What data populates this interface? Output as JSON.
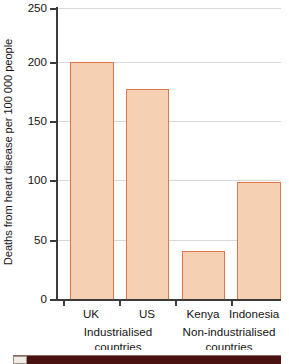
{
  "chart_data": {
    "type": "bar",
    "title": "",
    "xlabel": "",
    "ylabel": "Deaths from heart disease per 100 000 people",
    "categories": [
      "UK",
      "US",
      "Kenya",
      "Indonesia"
    ],
    "values": [
      204,
      181,
      42,
      101
    ],
    "ylim": [
      0,
      250
    ],
    "yticks": [
      0,
      50,
      100,
      150,
      200,
      250
    ],
    "ytick_labels": [
      "0",
      "50",
      "100",
      "150",
      "200",
      "250"
    ],
    "grid": true,
    "legend": "none",
    "groups": [
      {
        "label_line1": "Industrialised",
        "label_line2": "countries",
        "categories": [
          "UK",
          "US"
        ]
      },
      {
        "label_line1": "Non-industrialised",
        "label_line2": "countries",
        "categories": [
          "Kenya",
          "Indonesia"
        ]
      }
    ],
    "colors": {
      "bar_fill": "#f6d0b2",
      "bar_edge": "#e0774c",
      "grid": "#d9d9d9",
      "axis": "#3b3b3b",
      "text": "#141414",
      "background": "#ffffff",
      "bottom_strip": "#4a1210"
    }
  },
  "axis": {
    "y_title": "Deaths from heart disease per 100 000 people",
    "y_ticks": [
      {
        "label": "250",
        "value": 250
      },
      {
        "label": "200",
        "value": 200
      },
      {
        "label": "150",
        "value": 150
      },
      {
        "label": "100",
        "value": 100
      },
      {
        "label": "50",
        "value": 50
      },
      {
        "label": "0",
        "value": 0
      }
    ]
  },
  "bars": [
    {
      "category": "UK",
      "value": 204
    },
    {
      "category": "US",
      "value": 181
    },
    {
      "category": "Kenya",
      "value": 42
    },
    {
      "category": "Indonesia",
      "value": 101
    }
  ],
  "group_labels": [
    {
      "line1": "Industrialised",
      "line2": "countries"
    },
    {
      "line1": "Non-industrialised",
      "line2": "countries"
    }
  ]
}
